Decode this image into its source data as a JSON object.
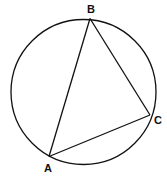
{
  "diagram": {
    "type": "inscribed-triangle-in-circle",
    "circle": {
      "cx": 83.5,
      "cy": 92,
      "r": 72.5
    },
    "points": [
      {
        "name": "A",
        "x": 49,
        "y": 156.5,
        "label_x": 48,
        "label_y": 172
      },
      {
        "name": "B",
        "x": 90,
        "y": 18.5,
        "label_x": 91,
        "label_y": 13
      },
      {
        "name": "C",
        "x": 150,
        "y": 115,
        "label_x": 158,
        "label_y": 124
      }
    ],
    "segments": [
      {
        "from": "A",
        "to": "B"
      },
      {
        "from": "B",
        "to": "C"
      },
      {
        "from": "C",
        "to": "A"
      }
    ],
    "labels": {
      "A": "A",
      "B": "B",
      "C": "C"
    },
    "colors": {
      "stroke": "#111111",
      "background": "#ffffff"
    }
  }
}
